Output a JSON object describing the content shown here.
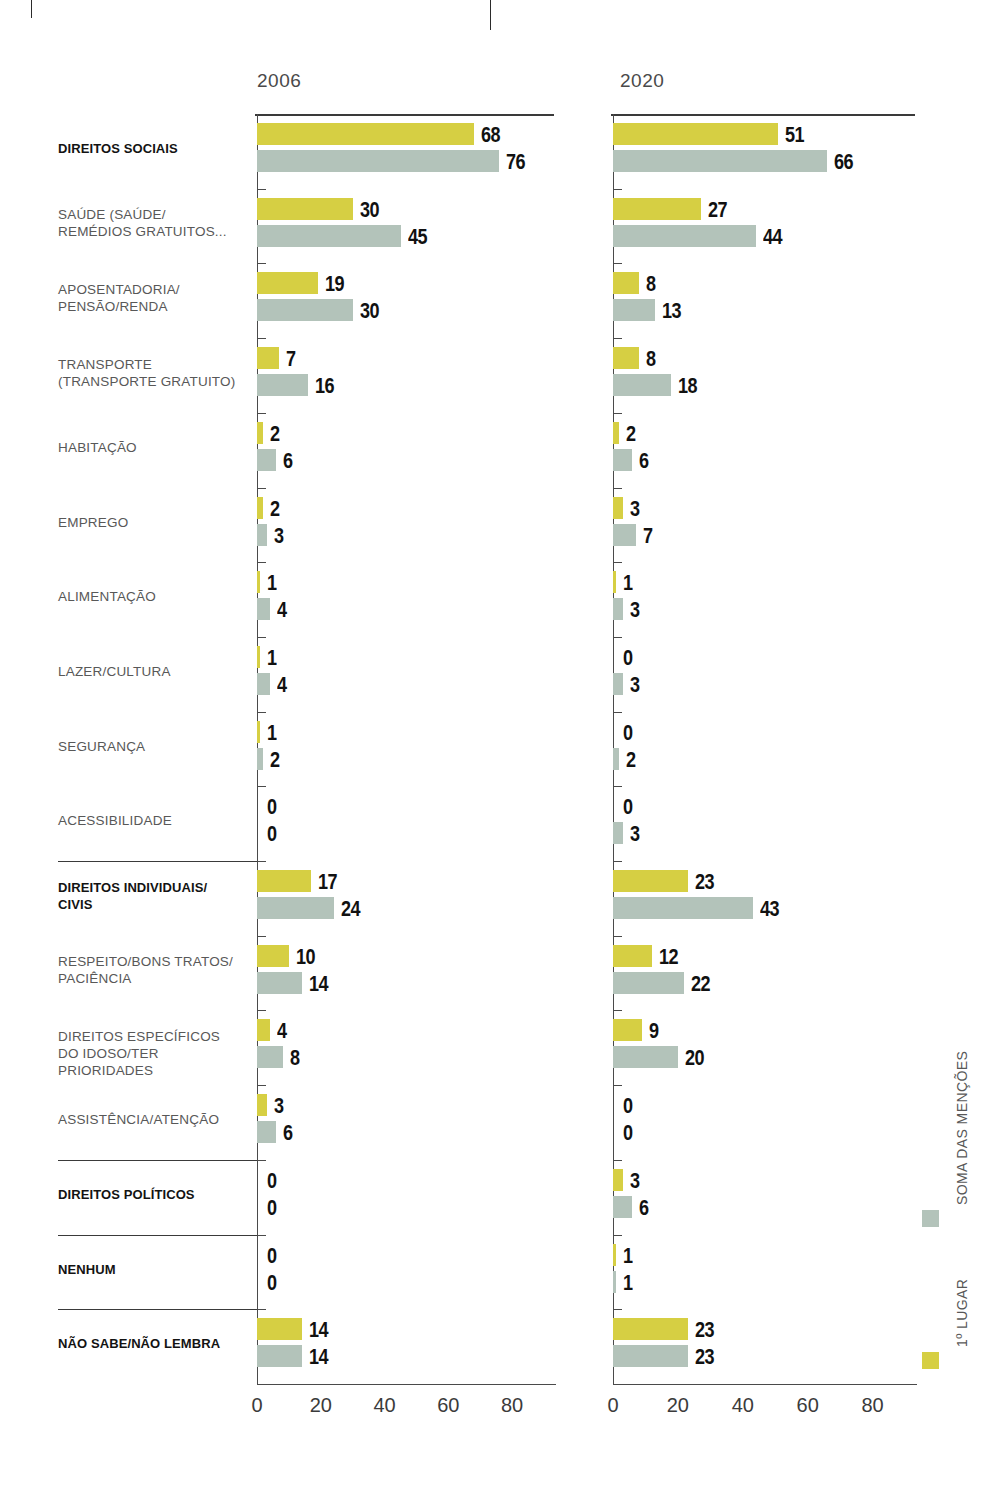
{
  "panels": [
    {
      "id": "panel-2006",
      "year": "2006"
    },
    {
      "id": "panel-2020",
      "year": "2020"
    }
  ],
  "axis": {
    "ticks": [
      "0",
      "20",
      "40",
      "60",
      "80"
    ],
    "min": 0,
    "max": 90
  },
  "legend": {
    "total": {
      "label": "SOMA DAS MENÇÕES",
      "color": "#b3c3ba"
    },
    "first": {
      "label": "1º LUGAR",
      "color": "#d6cf43"
    }
  },
  "categories": [
    {
      "label": "DIREITOS SOCIAIS",
      "bold": true,
      "lines": [
        "DIREITOS SOCIAIS"
      ]
    },
    {
      "label": "SAÚDE (SAÚDE/ REMÉDIOS GRATUITOS...",
      "bold": false,
      "lines": [
        "SAÚDE (SAÚDE/",
        "REMÉDIOS GRATUITOS..."
      ]
    },
    {
      "label": "APOSENTADORIA/ PENSÃO/RENDA",
      "bold": false,
      "lines": [
        "APOSENTADORIA/",
        "PENSÃO/RENDA"
      ]
    },
    {
      "label": "TRANSPORTE (TRANSPORTE GRATUITO)",
      "bold": false,
      "lines": [
        "TRANSPORTE",
        "(TRANSPORTE GRATUITO)"
      ]
    },
    {
      "label": "HABITAÇÃO",
      "bold": false,
      "lines": [
        "HABITAÇÃO"
      ]
    },
    {
      "label": "EMPREGO",
      "bold": false,
      "lines": [
        "EMPREGO"
      ]
    },
    {
      "label": "ALIMENTAÇÃO",
      "bold": false,
      "lines": [
        "ALIMENTAÇÃO"
      ]
    },
    {
      "label": "LAZER/CULTURA",
      "bold": false,
      "lines": [
        "LAZER/CULTURA"
      ]
    },
    {
      "label": "SEGURANÇA",
      "bold": false,
      "lines": [
        "SEGURANÇA"
      ]
    },
    {
      "label": "ACESSIBILIDADE",
      "bold": false,
      "lines": [
        "ACESSIBILIDADE"
      ]
    },
    {
      "label": "DIREITOS INDIVIDUAIS/ CIVIS",
      "bold": true,
      "lines": [
        "DIREITOS INDIVIDUAIS/",
        "CIVIS"
      ]
    },
    {
      "label": "RESPEITO/BONS TRATOS/ PACIÊNCIA",
      "bold": false,
      "lines": [
        "RESPEITO/BONS TRATOS/",
        "PACIÊNCIA"
      ]
    },
    {
      "label": "DIREITOS ESPECÍFICOS DO IDOSO/TER PRIORIDADES",
      "bold": false,
      "lines": [
        "DIREITOS ESPECÍFICOS",
        "DO IDOSO/TER PRIORIDADES"
      ]
    },
    {
      "label": "ASSISTÊNCIA/ATENÇÃO",
      "bold": false,
      "lines": [
        "ASSISTÊNCIA/ATENÇÃO"
      ]
    },
    {
      "label": "DIREITOS POLÍTICOS",
      "bold": true,
      "lines": [
        "DIREITOS POLÍTICOS"
      ]
    },
    {
      "label": "NENHUM",
      "bold": true,
      "lines": [
        "NENHUM"
      ]
    },
    {
      "label": "NÃO SABE/NÃO LEMBRA",
      "bold": true,
      "lines": [
        "NÃO SABE/NÃO LEMBRA"
      ]
    }
  ],
  "group_separators_after": [
    9,
    13,
    14,
    15
  ],
  "chart_data": {
    "type": "bar",
    "title": "",
    "xlabel": "",
    "ylabel": "",
    "xlim": [
      0,
      90
    ],
    "grid": false,
    "legend_position": "right-vertical",
    "orientation": "horizontal-grouped",
    "categories": [
      "DIREITOS SOCIAIS",
      "SAÚDE (SAÚDE/REMÉDIOS GRATUITOS...",
      "APOSENTADORIA/PENSÃO/RENDA",
      "TRANSPORTE (TRANSPORTE GRATUITO)",
      "HABITAÇÃO",
      "EMPREGO",
      "ALIMENTAÇÃO",
      "LAZER/CULTURA",
      "SEGURANÇA",
      "ACESSIBILIDADE",
      "DIREITOS INDIVIDUAIS/CIVIS",
      "RESPEITO/BONS TRATOS/PACIÊNCIA",
      "DIREITOS ESPECÍFICOS DO IDOSO/TER PRIORIDADES",
      "ASSISTÊNCIA/ATENÇÃO",
      "DIREITOS POLÍTICOS",
      "NENHUM",
      "NÃO SABE/NÃO LEMBRA"
    ],
    "panels": [
      {
        "year": "2006",
        "series": [
          {
            "name": "1º LUGAR",
            "color": "#d6cf43",
            "values": [
              68,
              30,
              19,
              7,
              2,
              2,
              1,
              1,
              1,
              0,
              17,
              10,
              4,
              3,
              0,
              0,
              14
            ]
          },
          {
            "name": "SOMA DAS MENÇÕES",
            "color": "#b3c3ba",
            "values": [
              76,
              45,
              30,
              16,
              6,
              3,
              4,
              4,
              2,
              0,
              24,
              14,
              8,
              6,
              0,
              0,
              14
            ]
          }
        ]
      },
      {
        "year": "2020",
        "series": [
          {
            "name": "1º LUGAR",
            "color": "#d6cf43",
            "values": [
              51,
              27,
              8,
              8,
              2,
              3,
              1,
              0,
              0,
              0,
              23,
              12,
              9,
              0,
              3,
              1,
              23
            ]
          },
          {
            "name": "SOMA DAS MENÇÕES",
            "color": "#b3c3ba",
            "values": [
              66,
              44,
              13,
              18,
              6,
              7,
              3,
              3,
              2,
              3,
              43,
              22,
              20,
              0,
              6,
              1,
              23
            ]
          }
        ]
      }
    ]
  }
}
